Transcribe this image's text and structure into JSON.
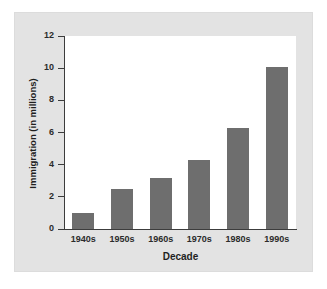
{
  "chart_data": {
    "type": "bar",
    "title": "",
    "xlabel": "Decade",
    "ylabel": "Immigration (in millions)",
    "categories": [
      "1940s",
      "1950s",
      "1960s",
      "1970s",
      "1980s",
      "1990s"
    ],
    "values": [
      1.0,
      2.5,
      3.2,
      4.3,
      6.3,
      10.1
    ],
    "ylim": [
      0,
      12
    ],
    "ytick_labels": [
      "0",
      "2",
      "4",
      "6",
      "8",
      "10",
      "12"
    ],
    "ytick_values": [
      0,
      2,
      4,
      6,
      8,
      10,
      12
    ],
    "grid": false,
    "legend": false,
    "bar_color": "#6e6e6e",
    "plot_background": "#ffffff",
    "panel_background": "#e3e3e3",
    "axis_color": "#3c3c3c"
  }
}
